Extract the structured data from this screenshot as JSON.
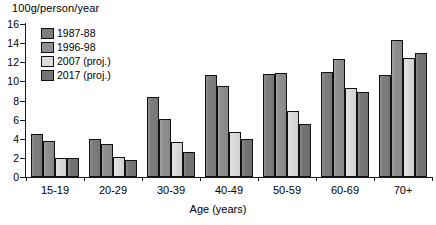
{
  "chart_data": {
    "type": "bar",
    "title": "",
    "ylabel": "100g/person/year",
    "xlabel": "Age (years)",
    "categories": [
      "15-19",
      "20-29",
      "30-39",
      "40-49",
      "50-59",
      "60-69",
      "70+"
    ],
    "series": [
      {
        "name": "1987-88",
        "color": "#7d7d7d",
        "values": [
          4.5,
          4.0,
          8.4,
          10.7,
          10.8,
          11.0,
          10.7
        ]
      },
      {
        "name": "1996-98",
        "color": "#8f8f8f",
        "values": [
          3.8,
          3.5,
          6.1,
          9.5,
          10.9,
          12.3,
          14.3
        ]
      },
      {
        "name": "2007 (proj.)",
        "color": "#dcdcdc",
        "values": [
          2.0,
          2.1,
          3.7,
          4.7,
          6.9,
          9.3,
          12.4
        ]
      },
      {
        "name": "2017 (proj.)",
        "color": "#757575",
        "values": [
          2.0,
          1.8,
          2.6,
          4.0,
          5.5,
          8.9,
          13.0
        ]
      }
    ],
    "ylim": [
      0,
      16
    ],
    "yticks": [
      0,
      2,
      4,
      6,
      8,
      10,
      12,
      14,
      16
    ],
    "ytick_labels": [
      "0",
      "2",
      "4",
      "6",
      "8",
      "10",
      "12",
      "14",
      "16"
    ],
    "grid": false,
    "legend_position": "top-left-inside"
  },
  "legend": {
    "items": [
      {
        "label": "1987-88",
        "swatch": "#7d7d7d"
      },
      {
        "label": "1996-98",
        "swatch": "#8f8f8f"
      },
      {
        "label": "2007 (proj.)",
        "swatch": "#dcdcdc"
      },
      {
        "label": "2017 (proj.)",
        "swatch": "#757575"
      }
    ]
  }
}
